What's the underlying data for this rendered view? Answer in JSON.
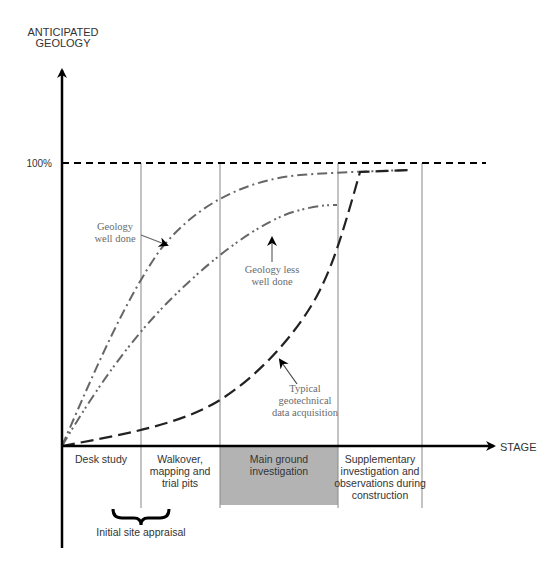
{
  "y_axis": {
    "title_line1": "ANTICIPATED",
    "title_line2": "GEOLOGY",
    "max_tick_label": "100%"
  },
  "x_axis": {
    "title": "STAGE"
  },
  "stages": [
    {
      "lines": [
        "Desk study"
      ],
      "shaded": false
    },
    {
      "lines": [
        "Walkover,",
        "mapping and",
        "trial pits"
      ],
      "shaded": false
    },
    {
      "lines": [
        "Main ground",
        "investigation"
      ],
      "shaded": true
    },
    {
      "lines": [
        "Supplementary",
        "investigation and",
        "observations during",
        "construction"
      ],
      "shaded": false
    }
  ],
  "brace_label": "Initial site appraisal",
  "curves": [
    {
      "name": "Geology well done",
      "label_lines": [
        "Geology",
        "well done"
      ],
      "style": "dash-dot",
      "color": "#666666"
    },
    {
      "name": "Geology less well done",
      "label_lines": [
        "Geology less",
        "well done"
      ],
      "style": "dash-dot-dot",
      "color": "#666666"
    },
    {
      "name": "Typical geotechnical data acquisition",
      "label_lines": [
        "Typical",
        "geotechnical",
        "data acquisition"
      ],
      "style": "long-dash",
      "color": "#222222"
    }
  ],
  "colors": {
    "axis": "#000000",
    "stage_divider": "#888888",
    "shaded_stage": "#b3b3b3",
    "reference_line": "#000000"
  }
}
